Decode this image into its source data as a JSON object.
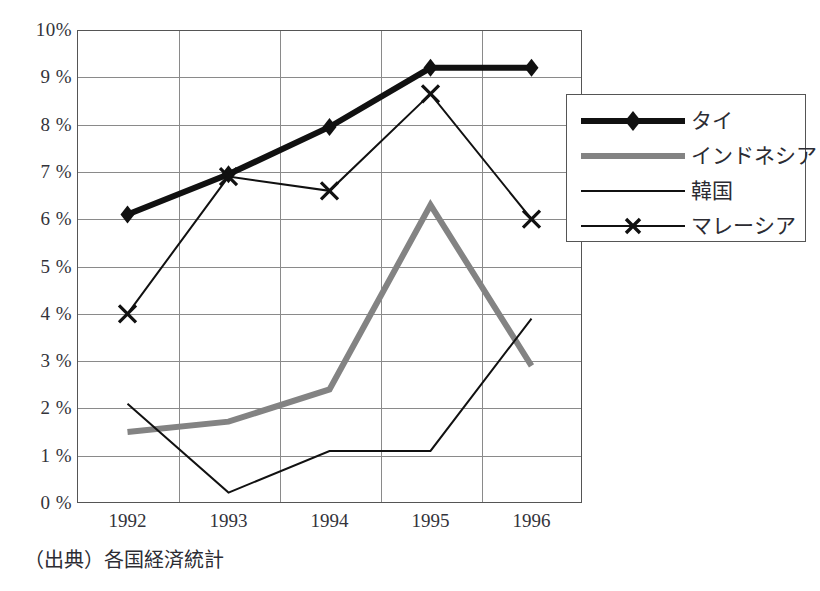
{
  "chart_data": {
    "type": "line",
    "title": "",
    "subtitle": "",
    "xlabel": "",
    "ylabel": "",
    "categories": [
      "1992",
      "1993",
      "1994",
      "1995",
      "1996"
    ],
    "x": [
      1992,
      1993,
      1994,
      1995,
      1996
    ],
    "ylim": [
      0,
      10
    ],
    "ytick_labels": [
      "10%",
      "9 %",
      "8 %",
      "7 %",
      "6 %",
      "5 %",
      "4 %",
      "3 %",
      "2 %",
      "1 %",
      "0 %"
    ],
    "ytick_values": [
      10,
      9,
      8,
      7,
      6,
      5,
      4,
      3,
      2,
      1,
      0
    ],
    "grid": true,
    "legend_position": "right-top",
    "series": [
      {
        "name": "タイ",
        "values": [
          6.1,
          6.95,
          7.95,
          9.2,
          9.2
        ],
        "color": "#111111",
        "width": 6,
        "marker": "diamond"
      },
      {
        "name": "インドネシア",
        "values": [
          1.5,
          1.72,
          2.4,
          6.3,
          2.9
        ],
        "color": "#838383",
        "width": 6,
        "marker": "none"
      },
      {
        "name": "韓国",
        "values": [
          2.1,
          0.22,
          1.1,
          1.1,
          3.9
        ],
        "color": "#111111",
        "width": 2,
        "marker": "none"
      },
      {
        "name": "マレーシア",
        "values": [
          4.0,
          6.9,
          6.6,
          8.65,
          6.0
        ],
        "color": "#111111",
        "width": 2,
        "marker": "x"
      }
    ],
    "annotations": []
  },
  "caption": {
    "text": "（出典）各国経済統計"
  },
  "legend": {
    "items": [
      {
        "label": "タイ"
      },
      {
        "label": "インドネシア"
      },
      {
        "label": "韓国"
      },
      {
        "label": "マレーシア"
      }
    ]
  },
  "colors": {
    "axis": "#555555",
    "grid": "#8a8a8a",
    "text": "#2c2c33",
    "series_dark": "#111111",
    "series_gray": "#838383",
    "background": "#ffffff"
  }
}
